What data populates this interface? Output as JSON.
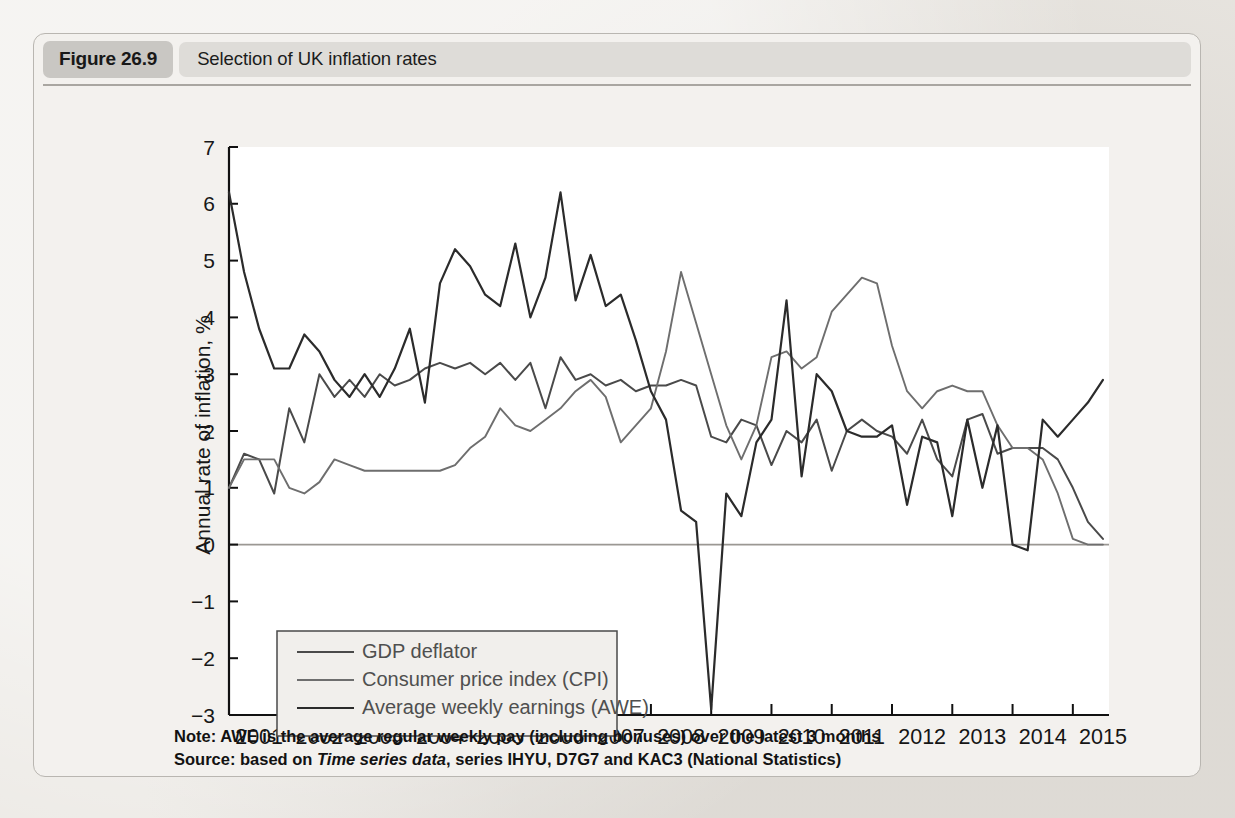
{
  "figure": {
    "number": "Figure 26.9",
    "title": "Selection of UK inflation rates",
    "note": "Note: AWE is the average regular weekly pay (including bonuses) over the latest 3 months",
    "source_prefix": "Source: based on ",
    "source_italic": "Time series data",
    "source_suffix": ", series IHYU, D7G7 and KAC3 (National Statistics)"
  },
  "colors": {
    "gdp_deflator": "#4a4a4a",
    "cpi": "#6e6e6e",
    "awe": "#2b2b2b",
    "figure_border": "#b9b6b1",
    "header_pill": "#c9c7c3",
    "header_bar": "#dedcd8",
    "plot_background": "#ffffff",
    "zero_line": "#9b9893"
  },
  "chart_data": {
    "type": "line",
    "title": "Selection of UK inflation rates",
    "xlabel": "",
    "ylabel": "Annual rate of inflation, %",
    "ylim": [
      -3,
      7
    ],
    "xlim": [
      2001.0,
      2015.6
    ],
    "ytick_labels": [
      "7",
      "6",
      "5",
      "4",
      "3",
      "2",
      "1",
      "0",
      "−1",
      "−2",
      "−3"
    ],
    "ytick_values": [
      7,
      6,
      5,
      4,
      3,
      2,
      1,
      0,
      -1,
      -2,
      -3
    ],
    "xtick_labels": [
      "2001",
      "2002",
      "2003",
      "2004",
      "2005",
      "2006",
      "2007",
      "2008",
      "2009",
      "2010",
      "2011",
      "2012",
      "2013",
      "2014",
      "2015"
    ],
    "xtick_values": [
      2001,
      2002,
      2003,
      2004,
      2005,
      2006,
      2007,
      2008,
      2009,
      2010,
      2011,
      2012,
      2013,
      2014,
      2015
    ],
    "grid": false,
    "legend_position": "lower-left",
    "frequency": "quarterly",
    "x": [
      2001.0,
      2001.25,
      2001.5,
      2001.75,
      2002.0,
      2002.25,
      2002.5,
      2002.75,
      2003.0,
      2003.25,
      2003.5,
      2003.75,
      2004.0,
      2004.25,
      2004.5,
      2004.75,
      2005.0,
      2005.25,
      2005.5,
      2005.75,
      2006.0,
      2006.25,
      2006.5,
      2006.75,
      2007.0,
      2007.25,
      2007.5,
      2007.75,
      2008.0,
      2008.25,
      2008.5,
      2008.75,
      2009.0,
      2009.25,
      2009.5,
      2009.75,
      2010.0,
      2010.25,
      2010.5,
      2010.75,
      2011.0,
      2011.25,
      2011.5,
      2011.75,
      2012.0,
      2012.25,
      2012.5,
      2012.75,
      2013.0,
      2013.25,
      2013.5,
      2013.75,
      2014.0,
      2014.25,
      2014.5,
      2014.75,
      2015.0,
      2015.25,
      2015.5
    ],
    "series": [
      {
        "name": "GDP deflator",
        "color": "#4a4a4a",
        "values": [
          1.0,
          1.6,
          1.5,
          0.9,
          2.4,
          1.8,
          3.0,
          2.6,
          2.9,
          2.6,
          3.0,
          2.8,
          2.9,
          3.1,
          3.2,
          3.1,
          3.2,
          3.0,
          3.2,
          2.9,
          3.2,
          2.4,
          3.3,
          2.9,
          3.0,
          2.8,
          2.9,
          2.7,
          2.8,
          2.8,
          2.9,
          2.8,
          1.9,
          1.8,
          2.2,
          2.1,
          1.4,
          2.0,
          1.8,
          2.2,
          1.3,
          2.0,
          2.2,
          2.0,
          1.9,
          1.6,
          2.2,
          1.5,
          1.2,
          2.2,
          2.3,
          1.6,
          1.7,
          1.7,
          1.7,
          1.5,
          1.0,
          0.4,
          0.1
        ]
      },
      {
        "name": "Consumer price index (CPI)",
        "color": "#6e6e6e",
        "values": [
          1.0,
          1.5,
          1.5,
          1.5,
          1.0,
          0.9,
          1.1,
          1.5,
          1.4,
          1.3,
          1.3,
          1.3,
          1.3,
          1.3,
          1.3,
          1.4,
          1.7,
          1.9,
          2.4,
          2.1,
          2.0,
          2.2,
          2.4,
          2.7,
          2.9,
          2.6,
          1.8,
          2.1,
          2.4,
          3.4,
          4.8,
          3.9,
          3.0,
          2.1,
          1.5,
          2.1,
          3.3,
          3.4,
          3.1,
          3.3,
          4.1,
          4.4,
          4.7,
          4.6,
          3.5,
          2.7,
          2.4,
          2.7,
          2.8,
          2.7,
          2.7,
          2.1,
          1.7,
          1.7,
          1.5,
          0.9,
          0.1,
          0.0,
          0.0
        ]
      },
      {
        "name": "Average weekly earnings (AWE)",
        "color": "#2b2b2b",
        "values": [
          6.2,
          4.8,
          3.8,
          3.1,
          3.1,
          3.7,
          3.4,
          2.9,
          2.6,
          3.0,
          2.6,
          3.1,
          3.8,
          2.5,
          4.6,
          5.2,
          4.9,
          4.4,
          4.2,
          5.3,
          4.0,
          4.7,
          6.2,
          4.3,
          5.1,
          4.2,
          4.4,
          3.6,
          2.7,
          2.2,
          0.6,
          0.4,
          -2.9,
          0.9,
          0.5,
          1.8,
          2.2,
          4.3,
          1.2,
          3.0,
          2.7,
          2.0,
          1.9,
          1.9,
          2.1,
          0.7,
          1.9,
          1.8,
          0.5,
          2.2,
          1.0,
          2.1,
          0.0,
          -0.1,
          2.2,
          1.9,
          2.2,
          2.5,
          2.9
        ]
      }
    ]
  },
  "legend": {
    "items": [
      {
        "label": "GDP deflator",
        "color": "#4a4a4a"
      },
      {
        "label": "Consumer price index (CPI)",
        "color": "#6e6e6e"
      },
      {
        "label": "Average weekly earnings (AWE)",
        "color": "#2b2b2b"
      }
    ]
  }
}
